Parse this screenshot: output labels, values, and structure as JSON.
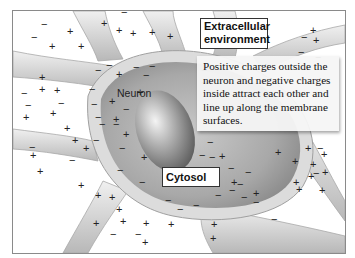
{
  "diagram": {
    "labels": {
      "extracellular": "Extracellular environment",
      "extracellular_line1": "Extracellular",
      "extracellular_line2": "environment",
      "neuron": "Neuron",
      "cytosol": "Cytosol"
    },
    "callout": {
      "text": "Positive charges outside the neuron and negative charges inside attract each other and line up along the membrane surfaces."
    },
    "charges": {
      "outside": "+",
      "inside": "−"
    },
    "colors": {
      "background": "#ffffff",
      "membrane": "#d8d8d8",
      "cytosol": "#9a9a9a",
      "nucleus": "#7a7a7a",
      "frame": "#8a8a8a"
    }
  }
}
